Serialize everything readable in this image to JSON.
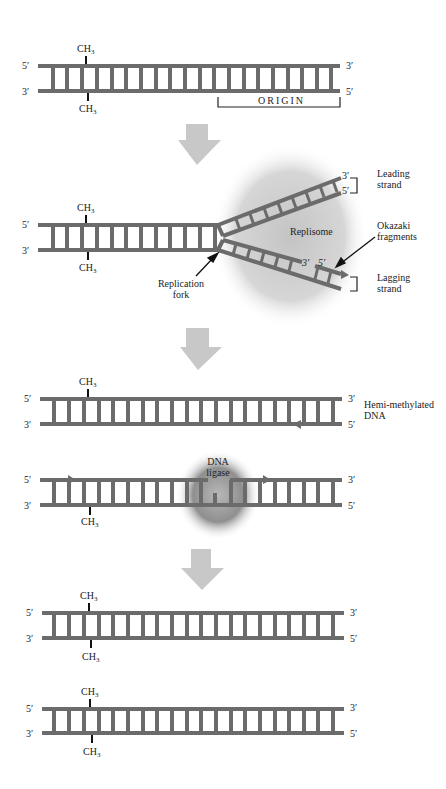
{
  "figure": {
    "panels": [
      {
        "id": "parental-duplex",
        "top_left": "5′",
        "bottom_left": "3′",
        "top_right": "3′",
        "bottom_right": "5′",
        "ch3_top": "CH",
        "ch3_bottom": "CH",
        "sub": "3",
        "origin_label": "ORIGIN"
      },
      {
        "id": "replication-fork",
        "top_left": "5′",
        "bottom_left": "3′",
        "ch3_top": "CH",
        "ch3_bottom": "CH",
        "sub": "3",
        "leading_3": "3′",
        "leading_5": "5′",
        "leading_label_1": "Leading",
        "leading_label_2": "strand",
        "replisome": "Replisome",
        "okazaki_1": "Okazaki",
        "okazaki_2": "fragments",
        "frag_3": "3′",
        "frag_5": "5′",
        "lagging_label_1": "Lagging",
        "lagging_label_2": "strand",
        "fork_label_1": "Replication",
        "fork_label_2": "fork"
      },
      {
        "id": "hemi-methylated",
        "top_left": "5′",
        "bottom_left": "3′",
        "top_right": "3′",
        "bottom_right": "5′",
        "ch3_top": "CH",
        "sub": "3",
        "label_1": "Hemi-methylated",
        "label_2": "DNA"
      },
      {
        "id": "dna-ligase",
        "top_left": "5′",
        "bottom_left": "3′",
        "top_right": "3′",
        "bottom_right": "5′",
        "ch3_bottom": "CH",
        "sub": "3",
        "ligase_1": "DNA",
        "ligase_2": "ligase"
      },
      {
        "id": "methylated-1",
        "top_left": "5′",
        "bottom_left": "3′",
        "top_right": "3′",
        "bottom_right": "5′",
        "ch3_top": "CH",
        "ch3_bottom": "CH",
        "sub": "3"
      },
      {
        "id": "methylated-2",
        "top_left": "5′",
        "bottom_left": "3′",
        "top_right": "3′",
        "bottom_right": "5′",
        "ch3_top": "CH",
        "ch3_bottom": "CH",
        "sub": "3"
      }
    ],
    "colors": {
      "strand": "#6b6b6b",
      "arrow": "#c8c8c8",
      "replisome": "#cfcfcf",
      "ligase": "#9a9a9a",
      "text": "#222222"
    }
  }
}
